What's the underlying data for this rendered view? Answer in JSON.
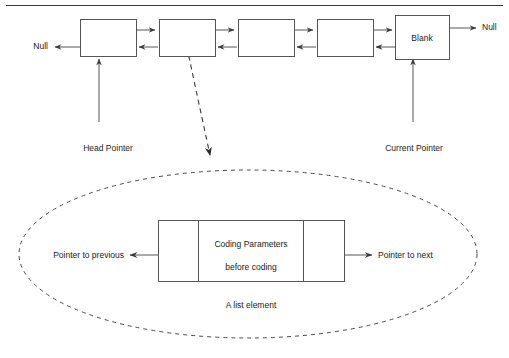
{
  "diagram": {
    "title_rule": "horizontal-rule",
    "top_list": {
      "null_left_label": "Null",
      "null_right_label": "Null",
      "blank_node_label": "Blank",
      "head_pointer_label": "Head Pointer",
      "current_pointer_label": "Current Pointer",
      "node_count": 5,
      "nodes": [
        {
          "label": ""
        },
        {
          "label": ""
        },
        {
          "label": ""
        },
        {
          "label": ""
        },
        {
          "label": "Blank"
        }
      ]
    },
    "detail": {
      "caption": "A list element",
      "prev_pointer_label": "Pointer to previous",
      "next_pointer_label": "Pointer to next",
      "payload_line1": "Coding Parameters",
      "payload_line2": "before coding"
    },
    "colors": {
      "stroke": "#555555",
      "text": "#1a1a1a",
      "background": "#ffffff",
      "rule": "#3a3a3a"
    }
  }
}
